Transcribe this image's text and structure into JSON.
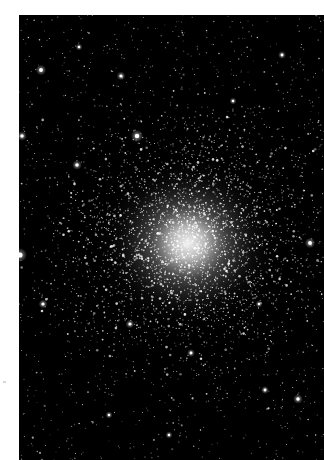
{
  "image": {
    "subject": "globular star cluster",
    "background_color": "#000000",
    "page_color": "#ffffff",
    "frame": {
      "x": 19,
      "y": 15,
      "width": 305,
      "height": 445
    },
    "core": {
      "cx": 169,
      "cy": 228,
      "radius": 95,
      "glow_color": "#ffffff"
    },
    "field_stars": {
      "count": 1400,
      "seed": 7
    },
    "cluster_stars": {
      "count": 2600,
      "seed": 13,
      "spread": 62
    },
    "bright_stars": [
      {
        "x": 1,
        "y": 240,
        "r": 3.2
      },
      {
        "x": 3,
        "y": 121,
        "r": 2.2
      },
      {
        "x": 22,
        "y": 55,
        "r": 2.4
      },
      {
        "x": 102,
        "y": 61,
        "r": 2.0
      },
      {
        "x": 58,
        "y": 150,
        "r": 2.2
      },
      {
        "x": 60,
        "y": 32,
        "r": 1.6
      },
      {
        "x": 118,
        "y": 121,
        "r": 2.8
      },
      {
        "x": 263,
        "y": 40,
        "r": 1.8
      },
      {
        "x": 279,
        "y": 384,
        "r": 2.2
      },
      {
        "x": 246,
        "y": 375,
        "r": 1.8
      },
      {
        "x": 291,
        "y": 228,
        "r": 2.4
      },
      {
        "x": 111,
        "y": 309,
        "r": 2.0
      },
      {
        "x": 172,
        "y": 338,
        "r": 1.8
      },
      {
        "x": 214,
        "y": 86,
        "r": 1.6
      },
      {
        "x": 24,
        "y": 289,
        "r": 2.0
      },
      {
        "x": 240,
        "y": 289,
        "r": 1.6
      },
      {
        "x": 90,
        "y": 400,
        "r": 1.6
      },
      {
        "x": 150,
        "y": 420,
        "r": 1.6
      }
    ]
  }
}
